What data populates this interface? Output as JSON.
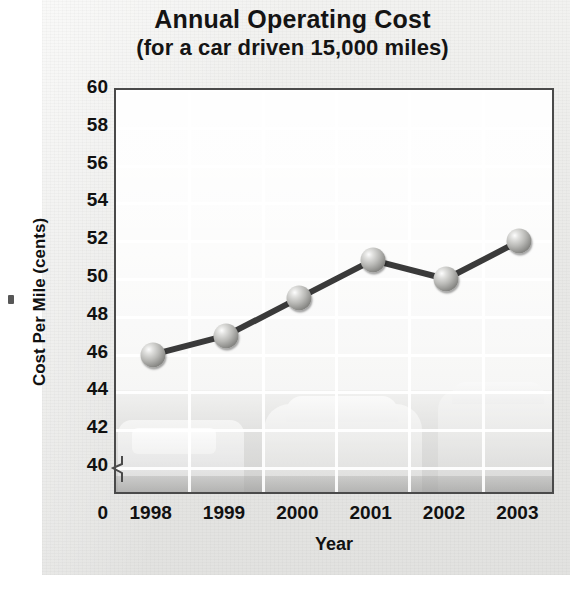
{
  "figure": {
    "title_main": "Annual Operating Cost",
    "title_sub": "(for a car driven 15,000 miles)"
  },
  "chart_data": {
    "type": "line",
    "title": "Annual Operating Cost (for a car driven 15,000 miles)",
    "xlabel": "Year",
    "ylabel": "Cost Per Mile (cents)",
    "categories": [
      "1998",
      "1999",
      "2000",
      "2001",
      "2002",
      "2003"
    ],
    "values": [
      46,
      47,
      49,
      51,
      50,
      52
    ],
    "series": [
      {
        "name": "Cost Per Mile (cents)",
        "values": [
          46,
          47,
          49,
          51,
          50,
          52
        ]
      }
    ],
    "ylim": [
      40,
      60
    ],
    "ytick_labels": [
      "60",
      "58",
      "56",
      "54",
      "52",
      "50",
      "48",
      "46",
      "44",
      "42",
      "40",
      "0"
    ],
    "ytick_values": [
      60,
      58,
      56,
      54,
      52,
      50,
      48,
      46,
      44,
      42,
      40,
      0
    ],
    "axis_break": true,
    "axis_break_between": [
      0,
      40
    ],
    "grid": true,
    "legend": "none",
    "marker_style": "3d-sphere",
    "line_color": "#3a3a3a",
    "marker_color": "#9a9a97",
    "grid_color": "#ffffff",
    "background": "faded grayscale photograph of parked cars"
  }
}
